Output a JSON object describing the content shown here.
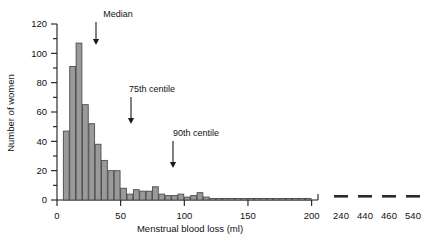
{
  "chart_data": {
    "type": "bar",
    "title": "",
    "xlabel": "Menstrual blood loss (ml)",
    "ylabel": "Number of women",
    "xlim": [
      0,
      205
    ],
    "ylim": [
      0,
      120
    ],
    "grid": false,
    "legend": null,
    "bin_width": 5,
    "x_tick_labels": [
      "0",
      "50",
      "100",
      "150",
      "200"
    ],
    "x_ticks": [
      0,
      50,
      100,
      150,
      200
    ],
    "y_tick_labels": [
      "0",
      "20",
      "40",
      "60",
      "80",
      "100",
      "120"
    ],
    "y_ticks": [
      0,
      20,
      40,
      60,
      80,
      100,
      120
    ],
    "y_minor_ticks": [
      10,
      30,
      50,
      70,
      90,
      110
    ],
    "bin_starts": [
      5,
      10,
      15,
      20,
      25,
      30,
      35,
      40,
      45,
      50,
      55,
      60,
      65,
      70,
      75,
      80,
      85,
      90,
      95,
      100,
      105,
      110,
      115,
      120,
      125,
      130,
      135,
      140,
      145,
      150,
      155,
      160,
      165,
      170,
      175,
      180,
      185,
      190,
      195
    ],
    "categories": [
      "5-10",
      "10-15",
      "15-20",
      "20-25",
      "25-30",
      "30-35",
      "35-40",
      "40-45",
      "45-50",
      "50-55",
      "55-60",
      "60-65",
      "65-70",
      "70-75",
      "75-80",
      "80-85",
      "85-90",
      "90-95",
      "95-100",
      "100-105",
      "105-110",
      "110-115",
      "115-120",
      "120-125",
      "125-130",
      "130-135",
      "135-140",
      "140-145",
      "145-150",
      "150-155",
      "155-160",
      "160-165",
      "165-170",
      "170-175",
      "175-180",
      "180-185",
      "185-190",
      "190-195",
      "195-200"
    ],
    "values": [
      47,
      91,
      107,
      65,
      52,
      38,
      27,
      20,
      20,
      8,
      4,
      7,
      6,
      6,
      9,
      4,
      3,
      3,
      4,
      2,
      3,
      5,
      2,
      1,
      1,
      1,
      1,
      1,
      1,
      1,
      1,
      1,
      1,
      1,
      1,
      1,
      1,
      1,
      1
    ],
    "axis_break_after": 200,
    "outliers": {
      "labels": [
        "240",
        "440",
        "460",
        "540"
      ],
      "values": [
        1,
        1,
        1,
        1
      ],
      "note": "isolated single-observation marks beyond broken axis"
    },
    "annotations": [
      {
        "label": "Median",
        "target_x": 28
      },
      {
        "label": "75th centile",
        "target_x": 50
      },
      {
        "label": "90th centile",
        "target_x": 79
      }
    ],
    "colors": {
      "bar_fill": "#9a9a9a",
      "bar_stroke": "#4a4a4a",
      "axis": "#1a1a1a",
      "text": "#111111",
      "background": "#ffffff"
    }
  }
}
